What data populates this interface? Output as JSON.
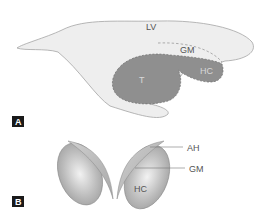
{
  "figure": {
    "panel_a": {
      "label": "A",
      "structures": {
        "lv": "LV",
        "gm": "GM",
        "t": "T",
        "hc": "HC"
      }
    },
    "panel_b": {
      "label": "B",
      "structures": {
        "ah": "AH",
        "gm": "GM",
        "hc": "HC"
      }
    },
    "colors": {
      "ventricle_fill": "#eeeeee",
      "outline": "#9a9a9a",
      "thalamus_fill": "#8f8f8f",
      "text": "#555555",
      "panel_label_bg": "#1a1a1a"
    }
  }
}
